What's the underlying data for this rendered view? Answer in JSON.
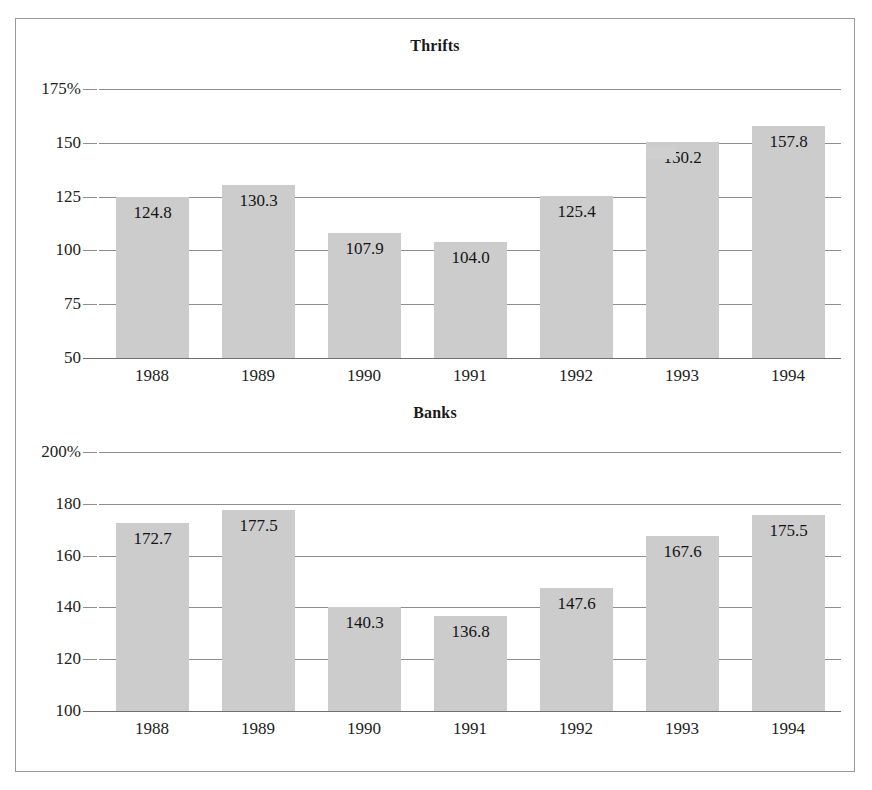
{
  "figure": {
    "background": "#ffffff",
    "border_color": "#9a9a9a",
    "bar_color": "#cccccc",
    "grid_color": "#8e8e8e"
  },
  "chart_data": [
    {
      "type": "bar",
      "title": "Thrifts",
      "xlabel": "",
      "ylabel": "",
      "categories": [
        "1988",
        "1989",
        "1990",
        "1991",
        "1992",
        "1993",
        "1994"
      ],
      "values": [
        124.8,
        130.3,
        107.9,
        104.0,
        125.4,
        150.2,
        157.8
      ],
      "data_labels": [
        "124.8",
        "130.3",
        "107.9",
        "104.0",
        "125.4",
        "150.2",
        "157.8"
      ],
      "ytick_labels": [
        "175%",
        "150",
        "125",
        "100",
        "75",
        "50"
      ],
      "ytick_values": [
        175,
        150,
        125,
        100,
        75,
        50
      ],
      "ylim": [
        50,
        175
      ],
      "grid": true,
      "legend": "none"
    },
    {
      "type": "bar",
      "title": "Banks",
      "xlabel": "",
      "ylabel": "",
      "categories": [
        "1988",
        "1989",
        "1990",
        "1991",
        "1992",
        "1993",
        "1994"
      ],
      "values": [
        172.7,
        177.5,
        140.3,
        136.8,
        147.6,
        167.6,
        175.5
      ],
      "data_labels": [
        "172.7",
        "177.5",
        "140.3",
        "136.8",
        "147.6",
        "167.6",
        "175.5"
      ],
      "ytick_labels": [
        "200%",
        "180",
        "160",
        "140",
        "120",
        "100"
      ],
      "ytick_values": [
        200,
        180,
        160,
        140,
        120,
        100
      ],
      "ylim": [
        100,
        200
      ],
      "grid": true,
      "legend": "none"
    }
  ]
}
